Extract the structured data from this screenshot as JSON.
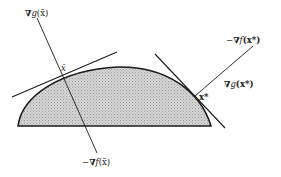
{
  "figure": {
    "region": {
      "fill": "#c8c8c8",
      "stroke": "#1a1a1a",
      "pattern": "dotted-shading"
    },
    "points": {
      "x_bar": {
        "label": "x̄"
      },
      "x_star": {
        "label": "x*"
      }
    },
    "labels": {
      "grad_g_xbar": {
        "nabla": "∇",
        "func": "g",
        "arg": "(x̄)"
      },
      "neg_grad_f_xbar": {
        "prefix": "−",
        "nabla": "∇",
        "func": "f",
        "arg": "(x̄)"
      },
      "neg_grad_f_xstar": {
        "prefix": "−",
        "nabla": "∇",
        "func": "f",
        "arg": "(x*)"
      },
      "grad_g_xstar": {
        "nabla": "∇",
        "func": "g",
        "arg": "(x*)"
      }
    }
  }
}
